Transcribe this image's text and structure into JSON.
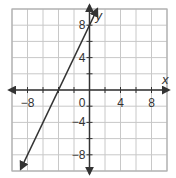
{
  "chart_data": {
    "type": "line",
    "title": "",
    "xlabel": "x",
    "ylabel": "y",
    "xlim": [
      -10,
      10
    ],
    "ylim": [
      -10,
      10
    ],
    "grid": true,
    "grid_step": 2,
    "x_ticks": [
      -8,
      4,
      8
    ],
    "y_ticks": [
      8,
      4,
      -4,
      -8
    ],
    "x_tick_labels": [
      "−8",
      "4",
      "8"
    ],
    "y_tick_labels": [
      "8",
      "4",
      "−4",
      "−8"
    ],
    "origin_label": "0",
    "series": [
      {
        "name": "line",
        "equation": "y = 2x + 8",
        "slope": 2,
        "intercept": 8,
        "x_intercept": -4,
        "x": [
          -9,
          -4,
          0,
          1
        ],
        "y": [
          -10,
          0,
          8,
          10
        ],
        "arrows": "both"
      }
    ],
    "colors": {
      "grid": "#c8c8c8",
      "axis": "#333333",
      "line": "#333333",
      "border": "#b0b0b0"
    }
  }
}
